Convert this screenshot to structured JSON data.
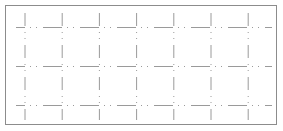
{
  "chart_data": {
    "type": "line",
    "title": "",
    "xlabel": "",
    "ylabel": "",
    "series": [],
    "grid": true,
    "legend": null,
    "x_gridlines": 7,
    "y_gridlines": 3,
    "colors": {
      "border": "#8c8c8c",
      "grid": "#9a9a9a",
      "background": "#ffffff"
    }
  }
}
